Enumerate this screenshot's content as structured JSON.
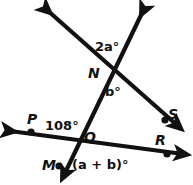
{
  "figure": {
    "type": "geometry-diagram",
    "stroke_color": "#111111",
    "background_color": "#ffffff",
    "points": {
      "N": {
        "label": "N",
        "x": 112,
        "y": 70
      },
      "Q": {
        "label": "Q",
        "x": 78,
        "y": 139
      },
      "P": {
        "label": "P",
        "x": 31,
        "y": 132
      },
      "R": {
        "label": "R",
        "x": 167,
        "y": 154
      },
      "S": {
        "label": "S",
        "x": 166,
        "y": 121
      },
      "M": {
        "label": "M",
        "x": 59,
        "y": 166
      }
    },
    "angles": [
      {
        "name": "angle-2a",
        "text": "2a°",
        "x": 95,
        "y": 40
      },
      {
        "name": "angle-b",
        "text": "b°",
        "x": 105,
        "y": 85
      },
      {
        "name": "angle-108",
        "text": "108°",
        "x": 45,
        "y": 119
      },
      {
        "name": "angle-a-plus-b",
        "text": "(a + b)°",
        "x": 72,
        "y": 158
      }
    ],
    "point_labels": [
      {
        "name": "point-label-N",
        "text": "N",
        "x": 88,
        "y": 66
      },
      {
        "name": "point-label-Q",
        "text": "Q",
        "x": 84,
        "y": 130
      },
      {
        "name": "point-label-P",
        "text": "P",
        "x": 27,
        "y": 112
      },
      {
        "name": "point-label-S",
        "text": "S",
        "x": 168,
        "y": 107
      },
      {
        "name": "point-label-R",
        "text": "R",
        "x": 155,
        "y": 133
      },
      {
        "name": "point-label-M",
        "text": "M",
        "x": 42,
        "y": 158
      }
    ],
    "lines": [
      {
        "name": "line-upleft-to-S",
        "from": {
          "x": 43,
          "y": 6
        },
        "to": {
          "x": 182,
          "y": 130
        },
        "arrow_start": true,
        "arrow_end": true
      },
      {
        "name": "line-upright-to-M",
        "from": {
          "x": 146,
          "y": 6
        },
        "to": {
          "x": 62,
          "y": 180
        },
        "arrow_start": true,
        "arrow_end": true
      },
      {
        "name": "line-P-to-R",
        "from": {
          "x": 5,
          "y": 131
        },
        "to": {
          "x": 188,
          "y": 155
        },
        "arrow_start": true,
        "arrow_end": true
      }
    ]
  }
}
